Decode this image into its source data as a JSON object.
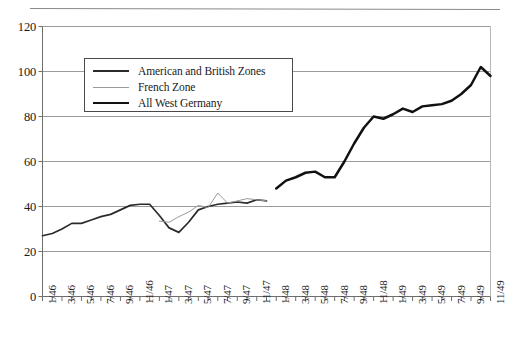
{
  "chart_data": {
    "type": "line",
    "title": "",
    "subtitle": "",
    "xlabel": "",
    "ylabel": "",
    "ylim": [
      0,
      120
    ],
    "yticks": [
      0,
      20,
      40,
      60,
      80,
      100,
      120
    ],
    "grid": true,
    "grid_axis": "y",
    "legend_position": "upper-left-inside",
    "x_tick_step_months": 2,
    "x": [
      "1/46",
      "2/46",
      "3/46",
      "4/46",
      "5/46",
      "6/46",
      "7/46",
      "8/46",
      "9/46",
      "10/46",
      "11/46",
      "12/46",
      "1/47",
      "2/47",
      "3/47",
      "4/47",
      "5/47",
      "6/47",
      "7/47",
      "8/47",
      "9/47",
      "10/47",
      "11/47",
      "12/47",
      "1/48",
      "2/48",
      "3/48",
      "4/48",
      "5/48",
      "6/48",
      "7/48",
      "8/48",
      "9/48",
      "10/48",
      "11/48",
      "12/48",
      "1/49",
      "2/49",
      "3/49",
      "4/49",
      "5/49",
      "6/49",
      "7/49",
      "8/49",
      "9/49",
      "10/49",
      "11/49"
    ],
    "xticklabels": [
      "1/46",
      "3/46",
      "5/46",
      "7/46",
      "9/46",
      "11/46",
      "1/47",
      "3/47",
      "5/47",
      "7/47",
      "9/47",
      "11/47",
      "1/48",
      "3/48",
      "5/48",
      "7/48",
      "9/48",
      "11/48",
      "1/49",
      "3/49",
      "5/49",
      "7/49",
      "9/49",
      "11/49"
    ],
    "series": [
      {
        "name": "American and British Zones",
        "color": "#2b2b2b",
        "width": 1.7,
        "values": [
          27,
          28,
          30,
          32.5,
          32.5,
          34,
          35.5,
          36.5,
          38.5,
          40.5,
          41,
          41,
          36,
          30.5,
          28.5,
          33,
          38.5,
          40,
          41,
          41.5,
          42,
          41.5,
          43,
          42.5,
          null,
          null,
          null,
          null,
          null,
          null,
          null,
          null,
          null,
          null,
          null,
          null,
          null,
          null,
          null,
          null,
          null,
          null,
          null,
          null,
          null,
          null,
          null
        ]
      },
      {
        "name": "French Zone",
        "color": "#9a9a9a",
        "width": 1.0,
        "values": [
          null,
          null,
          null,
          null,
          null,
          null,
          null,
          null,
          null,
          null,
          null,
          null,
          33.5,
          33,
          35.5,
          37.5,
          40.5,
          39.5,
          46,
          41.5,
          42.5,
          43.5,
          43,
          42.5,
          null,
          null,
          null,
          null,
          null,
          null,
          null,
          null,
          null,
          null,
          null,
          null,
          null,
          null,
          null,
          null,
          null,
          null,
          null,
          null,
          null,
          null,
          null
        ]
      },
      {
        "name": "All West Germany",
        "color": "#111111",
        "width": 2.5,
        "values": [
          null,
          null,
          null,
          null,
          null,
          null,
          null,
          null,
          null,
          null,
          null,
          null,
          null,
          null,
          null,
          null,
          null,
          null,
          null,
          null,
          null,
          null,
          null,
          null,
          48,
          51.5,
          53,
          55,
          55.5,
          53,
          53,
          60,
          68,
          75,
          80,
          79,
          81,
          83.5,
          82,
          84.5,
          85,
          85.5,
          87,
          90,
          94,
          102,
          98
        ]
      }
    ]
  },
  "legend": {
    "entries": [
      {
        "label": "American and British Zones",
        "style": "solid-dark-medium"
      },
      {
        "label": "French Zone",
        "style": "solid-gray-thin"
      },
      {
        "label": "All West Germany",
        "style": "solid-black-thick"
      }
    ]
  }
}
